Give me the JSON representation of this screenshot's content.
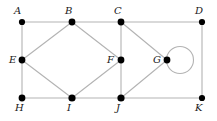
{
  "figure": {
    "width": 217,
    "height": 121,
    "background_color": "#ffffff",
    "edge_color": "#b3b3b3",
    "vertex_color": "#000000",
    "label_color": "#1a1a1a"
  },
  "vertices": [
    {
      "id": "A",
      "label": "A",
      "x": 22,
      "y": 22,
      "r": 3.1,
      "label_x": 14,
      "label_y": 6,
      "label_pos": "above-left"
    },
    {
      "id": "B",
      "label": "B",
      "x": 72,
      "y": 22,
      "r": 3.4,
      "label_x": 65,
      "label_y": 6,
      "label_pos": "above-left"
    },
    {
      "id": "C",
      "label": "C",
      "x": 121,
      "y": 22,
      "r": 3.4,
      "label_x": 114,
      "label_y": 6,
      "label_pos": "above-left"
    },
    {
      "id": "D",
      "label": "D",
      "x": 202,
      "y": 22,
      "r": 3.1,
      "label_x": 195,
      "label_y": 6,
      "label_pos": "above-left"
    },
    {
      "id": "E",
      "label": "E",
      "x": 22,
      "y": 60,
      "r": 3.4,
      "label_x": 9,
      "label_y": 55,
      "label_pos": "left"
    },
    {
      "id": "F",
      "label": "F",
      "x": 121,
      "y": 60,
      "r": 3.4,
      "label_x": 107,
      "label_y": 55,
      "label_pos": "left"
    },
    {
      "id": "G",
      "label": "G",
      "x": 167,
      "y": 60,
      "r": 3.4,
      "label_x": 153,
      "label_y": 55,
      "label_pos": "left"
    },
    {
      "id": "H",
      "label": "H",
      "x": 22,
      "y": 98,
      "r": 3.4,
      "label_x": 15,
      "label_y": 103,
      "label_pos": "below-left"
    },
    {
      "id": "I",
      "label": "I",
      "x": 72,
      "y": 98,
      "r": 3.6,
      "label_x": 67,
      "label_y": 103,
      "label_pos": "below-left"
    },
    {
      "id": "J",
      "label": "J",
      "x": 121,
      "y": 98,
      "r": 3.6,
      "label_x": 116,
      "label_y": 103,
      "label_pos": "below-left"
    },
    {
      "id": "K",
      "label": "K",
      "x": 202,
      "y": 98,
      "r": 3.1,
      "label_x": 195,
      "label_y": 103,
      "label_pos": "below-left"
    }
  ],
  "edges": [
    {
      "from": "A",
      "to": "B",
      "x1": 22,
      "y1": 22,
      "x2": 72,
      "y2": 22
    },
    {
      "from": "B",
      "to": "C",
      "x1": 72,
      "y1": 22,
      "x2": 121,
      "y2": 22
    },
    {
      "from": "C",
      "to": "D",
      "x1": 121,
      "y1": 22,
      "x2": 202,
      "y2": 22
    },
    {
      "from": "A",
      "to": "E",
      "x1": 22,
      "y1": 22,
      "x2": 22,
      "y2": 60
    },
    {
      "from": "E",
      "to": "H",
      "x1": 22,
      "y1": 60,
      "x2": 22,
      "y2": 98
    },
    {
      "from": "E",
      "to": "B",
      "x1": 22,
      "y1": 60,
      "x2": 72,
      "y2": 22
    },
    {
      "from": "B",
      "to": "F",
      "x1": 72,
      "y1": 22,
      "x2": 121,
      "y2": 60
    },
    {
      "from": "E",
      "to": "I",
      "x1": 22,
      "y1": 60,
      "x2": 72,
      "y2": 98
    },
    {
      "from": "F",
      "to": "I",
      "x1": 121,
      "y1": 60,
      "x2": 72,
      "y2": 98
    },
    {
      "from": "C",
      "to": "F",
      "x1": 121,
      "y1": 22,
      "x2": 121,
      "y2": 60
    },
    {
      "from": "F",
      "to": "J",
      "x1": 121,
      "y1": 60,
      "x2": 121,
      "y2": 98
    },
    {
      "from": "C",
      "to": "G",
      "x1": 121,
      "y1": 22,
      "x2": 167,
      "y2": 60
    },
    {
      "from": "G",
      "to": "J",
      "x1": 167,
      "y1": 60,
      "x2": 121,
      "y2": 98
    },
    {
      "from": "D",
      "to": "K",
      "x1": 202,
      "y1": 22,
      "x2": 202,
      "y2": 98
    },
    {
      "from": "H",
      "to": "I",
      "x1": 22,
      "y1": 98,
      "x2": 72,
      "y2": 98
    },
    {
      "from": "I",
      "to": "J",
      "x1": 72,
      "y1": 98,
      "x2": 121,
      "y2": 98
    },
    {
      "from": "J",
      "to": "K",
      "x1": 121,
      "y1": 98,
      "x2": 202,
      "y2": 98
    }
  ],
  "loops": [
    {
      "at": "G",
      "cx": 180,
      "cy": 60,
      "r": 13.5
    }
  ]
}
